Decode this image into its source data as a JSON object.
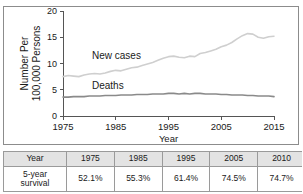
{
  "chart_data": {
    "type": "line",
    "title": "",
    "xlabel": "Year",
    "ylabel": "Number Per 100,000 Persons",
    "ylabel_line1": "Number Per",
    "ylabel_line2": "100,000 Persons",
    "xlim": [
      1975,
      2015
    ],
    "ylim": [
      0,
      20
    ],
    "xticks": [
      "1975",
      "1985",
      "1995",
      "2005",
      "2015"
    ],
    "xtick_values": [
      1975,
      1985,
      1995,
      2005,
      2015
    ],
    "yticks": [
      "0",
      "5",
      "10",
      "15",
      "20"
    ],
    "ytick_values": [
      0,
      5,
      10,
      15,
      20
    ],
    "grid": false,
    "legend_position": "inline-annotation",
    "colors": {
      "new_cases": "#cfcfcf",
      "deaths": "#8a8a8a",
      "axis": "#555555",
      "frame": "#8c8c8c",
      "table_header_bg": "#e3e3e3"
    },
    "annotations": [
      {
        "text": "New cases",
        "x": 1980.5,
        "y": 10.9
      },
      {
        "text": "Deaths",
        "x": 1980.5,
        "y": 5.2
      }
    ],
    "x": [
      1975,
      1976,
      1977,
      1978,
      1979,
      1980,
      1981,
      1982,
      1983,
      1984,
      1985,
      1986,
      1987,
      1988,
      1989,
      1990,
      1991,
      1992,
      1993,
      1994,
      1995,
      1996,
      1997,
      1998,
      1999,
      2000,
      2001,
      2002,
      2003,
      2004,
      2005,
      2006,
      2007,
      2008,
      2009,
      2010,
      2011,
      2012,
      2013,
      2014,
      2015
    ],
    "series": [
      {
        "name": "New cases",
        "color": "#cfcfcf",
        "values": [
          7.5,
          7.7,
          7.6,
          7.5,
          7.8,
          8.0,
          8.1,
          8.0,
          8.2,
          8.5,
          8.7,
          8.6,
          8.9,
          9.2,
          9.3,
          9.6,
          9.9,
          10.2,
          10.6,
          11.0,
          11.3,
          11.4,
          11.2,
          11.1,
          11.4,
          11.3,
          11.9,
          12.1,
          12.4,
          12.7,
          13.2,
          13.5,
          14.0,
          14.7,
          15.3,
          15.7,
          15.6,
          15.0,
          14.8,
          15.1,
          15.2
        ]
      },
      {
        "name": "Deaths",
        "color": "#8a8a8a",
        "values": [
          3.6,
          3.6,
          3.7,
          3.7,
          3.7,
          3.8,
          3.8,
          3.8,
          3.9,
          3.9,
          3.9,
          4.0,
          4.0,
          4.0,
          4.1,
          4.1,
          4.1,
          4.2,
          4.2,
          4.2,
          4.3,
          4.3,
          4.2,
          4.3,
          4.2,
          4.3,
          4.3,
          4.2,
          4.2,
          4.2,
          4.1,
          4.1,
          4.0,
          4.0,
          4.0,
          3.9,
          3.9,
          3.8,
          3.8,
          3.8,
          3.7
        ]
      }
    ]
  },
  "table": {
    "header": [
      "Year",
      "1975",
      "1985",
      "1995",
      "2005",
      "2010"
    ],
    "rows": [
      {
        "label_line1": "5-year",
        "label_line2": "survival",
        "values": [
          "52.1%",
          "55.3%",
          "61.4%",
          "74.5%",
          "74.7%"
        ]
      }
    ]
  }
}
